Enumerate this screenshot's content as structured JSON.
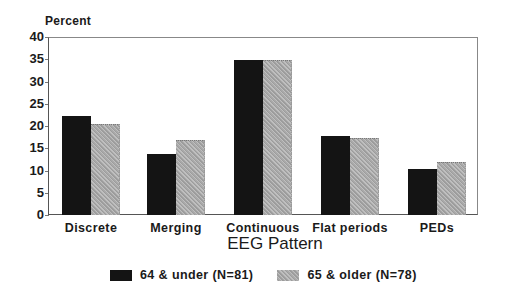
{
  "chart_data": {
    "type": "bar",
    "title": "",
    "xlabel": "EEG Pattern",
    "ylabel": "Percent",
    "ylim": [
      0,
      40
    ],
    "yticks": [
      0,
      5,
      10,
      15,
      20,
      25,
      30,
      35,
      40
    ],
    "categories": [
      "Discrete",
      "Merging",
      "Continuous",
      "Flat periods",
      "PEDs"
    ],
    "series": [
      {
        "name": "64 & under (N=81)",
        "color": "#141414",
        "values": [
          22.2,
          13.8,
          34.9,
          17.8,
          10.3
        ]
      },
      {
        "name": "65 & older (N=78)",
        "color": "#a9a9a9",
        "values": [
          20.5,
          16.9,
          34.8,
          17.3,
          12.0
        ]
      }
    ],
    "grid": false,
    "legend_position": "bottom"
  }
}
